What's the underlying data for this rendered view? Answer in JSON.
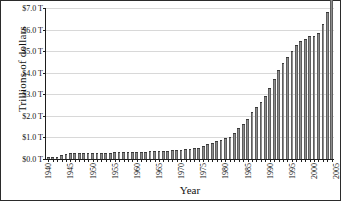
{
  "chart_data": {
    "type": "bar",
    "title": "",
    "xlabel": "Year",
    "ylabel": "Trillions of dollars",
    "ylim": [
      0,
      7.0
    ],
    "ytick_labels": [
      "$7.0 T",
      "$6.0 T",
      "$5.0 T",
      "$4.0 T",
      "$3.0 T",
      "$2.0 T",
      "$1.0 T",
      "$0.0 T"
    ],
    "ytick_values": [
      7.0,
      6.0,
      5.0,
      4.0,
      3.0,
      2.0,
      1.0,
      0.0
    ],
    "xtick_labels": [
      "1940",
      "1945",
      "1950",
      "1955",
      "1960",
      "1965",
      "1970",
      "1975",
      "1980",
      "1985",
      "1990",
      "1995",
      "2000",
      "2005"
    ],
    "grid": "horizontal",
    "legend": "none",
    "bar_color": "#6b6b6b",
    "axis_color": "#1d1d1d",
    "grid_color": "#d8d8d8",
    "categories": [
      1940,
      1941,
      1942,
      1943,
      1944,
      1945,
      1946,
      1947,
      1948,
      1949,
      1950,
      1951,
      1952,
      1953,
      1954,
      1955,
      1956,
      1957,
      1958,
      1959,
      1960,
      1961,
      1962,
      1963,
      1964,
      1965,
      1966,
      1967,
      1968,
      1969,
      1970,
      1971,
      1972,
      1973,
      1974,
      1975,
      1976,
      1977,
      1978,
      1979,
      1980,
      1981,
      1982,
      1983,
      1984,
      1985,
      1986,
      1987,
      1988,
      1989,
      1990,
      1991,
      1992,
      1993,
      1994,
      1995,
      1996,
      1997,
      1998,
      1999,
      2000,
      2001,
      2002,
      2003,
      2004
    ],
    "values": [
      0.04,
      0.05,
      0.07,
      0.12,
      0.18,
      0.23,
      0.24,
      0.23,
      0.22,
      0.22,
      0.23,
      0.23,
      0.24,
      0.25,
      0.25,
      0.26,
      0.26,
      0.26,
      0.27,
      0.28,
      0.28,
      0.29,
      0.3,
      0.31,
      0.31,
      0.32,
      0.32,
      0.33,
      0.35,
      0.35,
      0.37,
      0.4,
      0.43,
      0.46,
      0.48,
      0.54,
      0.63,
      0.71,
      0.78,
      0.83,
      0.91,
      0.99,
      1.14,
      1.37,
      1.56,
      1.82,
      2.12,
      2.35,
      2.6,
      2.86,
      3.23,
      3.67,
      4.06,
      4.41,
      4.69,
      4.97,
      5.22,
      5.41,
      5.53,
      5.66,
      5.67,
      5.81,
      6.23,
      6.78,
      7.38
    ]
  }
}
